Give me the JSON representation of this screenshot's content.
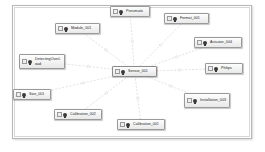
{
  "canvas": {
    "background": "#ffffff",
    "plate_border": "#b8b8b8",
    "edge_color": "#cfcfcf",
    "node_border": "#9a9a9a",
    "node_fill": "#f2f2f2"
  },
  "diagram": {
    "type": "node-link-graph",
    "center_node": "Sensor_001",
    "nodes": [
      {
        "id": "sensor",
        "label": "Sensor_001",
        "x": 112,
        "y": 66,
        "w": 45,
        "h": 11,
        "center": true
      },
      {
        "id": "pneumatic",
        "label": "Pneumatic",
        "x": 110,
        "y": 6,
        "w": 40,
        "h": 11,
        "center": false
      },
      {
        "id": "format",
        "label": "Format_001",
        "x": 164,
        "y": 13,
        "w": 45,
        "h": 11,
        "center": false
      },
      {
        "id": "module",
        "label": "Module_001",
        "x": 55,
        "y": 23,
        "w": 45,
        "h": 11,
        "center": false
      },
      {
        "id": "actuator",
        "label": "Actuator_004",
        "x": 194,
        "y": 37,
        "w": 48,
        "h": 11,
        "center": false
      },
      {
        "id": "detecting",
        "label": "DetectingOverLoad",
        "x": 19,
        "y": 54,
        "w": 46,
        "h": 15,
        "center": false
      },
      {
        "id": "philips",
        "label": "Philips",
        "x": 205,
        "y": 63,
        "w": 38,
        "h": 11,
        "center": false
      },
      {
        "id": "size",
        "label": "Size_001",
        "x": 13,
        "y": 89,
        "w": 38,
        "h": 11,
        "center": false
      },
      {
        "id": "installation",
        "label": "Installation_003",
        "x": 184,
        "y": 93,
        "w": 46,
        "h": 15,
        "center": false
      },
      {
        "id": "calibration2",
        "label": "Calibration_002",
        "x": 54,
        "y": 109,
        "w": 48,
        "h": 11,
        "center": false
      },
      {
        "id": "calibration1",
        "label": "Calibration_001",
        "x": 117,
        "y": 119,
        "w": 48,
        "h": 11,
        "center": false
      }
    ],
    "edges": [
      {
        "from": "sensor",
        "to": "pneumatic",
        "style": "dashed"
      },
      {
        "from": "sensor",
        "to": "format",
        "style": "dashed"
      },
      {
        "from": "sensor",
        "to": "module",
        "style": "dashed"
      },
      {
        "from": "sensor",
        "to": "actuator",
        "style": "dashed"
      },
      {
        "from": "sensor",
        "to": "detecting",
        "style": "dashed"
      },
      {
        "from": "sensor",
        "to": "philips",
        "style": "dashed"
      },
      {
        "from": "sensor",
        "to": "size",
        "style": "dashed"
      },
      {
        "from": "sensor",
        "to": "installation",
        "style": "dashed"
      },
      {
        "from": "sensor",
        "to": "calibration2",
        "style": "dashed"
      },
      {
        "from": "sensor",
        "to": "calibration1",
        "style": "dashed"
      }
    ]
  }
}
